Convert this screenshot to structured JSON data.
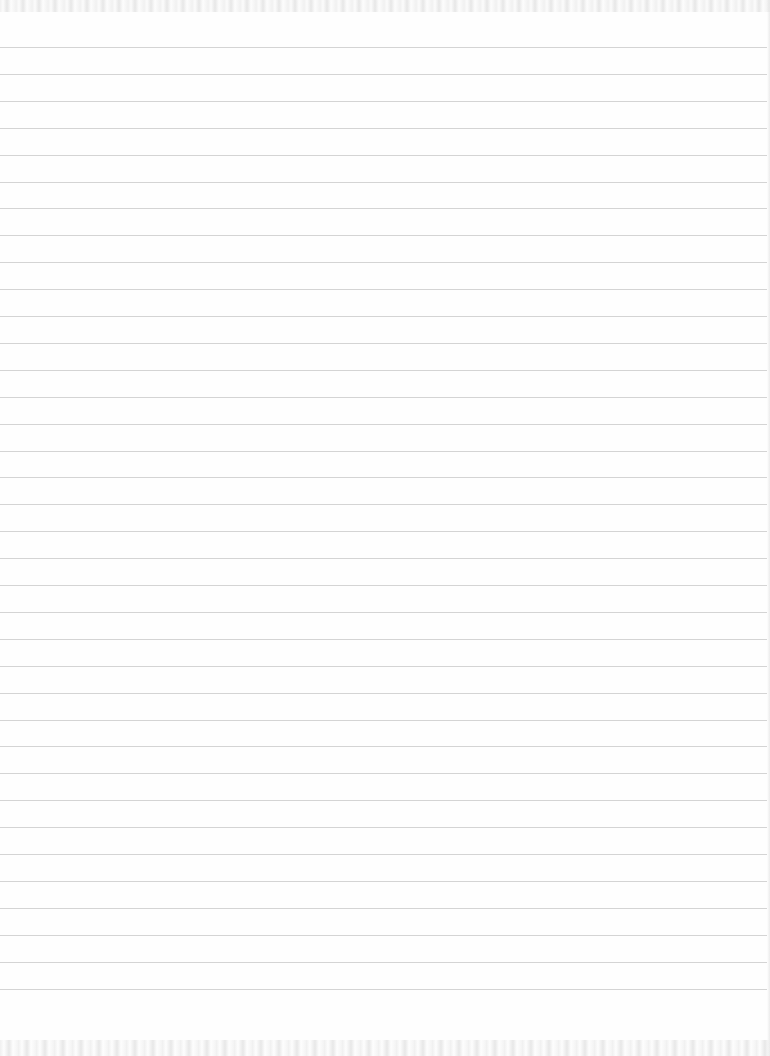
{
  "page": {
    "type": "blank lined paper",
    "width": 770,
    "height": 1056,
    "background_color": "#fefefe"
  },
  "ruled_lines": {
    "count": 36,
    "first_y": 47,
    "spacing": 26.9,
    "thickness": 1,
    "color": "#cfcfcf"
  },
  "text_content": []
}
